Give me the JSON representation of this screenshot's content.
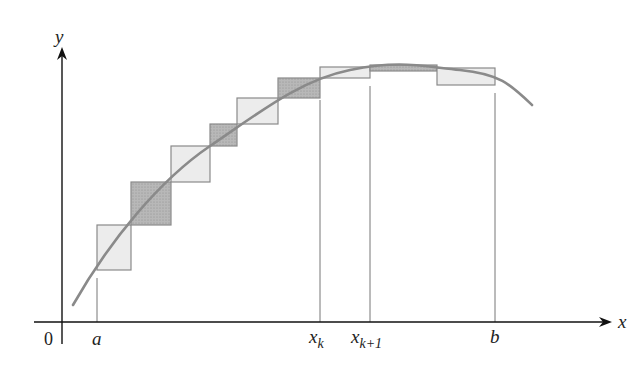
{
  "labels": {
    "y_axis": "y",
    "x_axis": "x",
    "origin": "0",
    "a": "a",
    "x_k_base": "x",
    "x_k_sub": "k",
    "x_k1_base": "x",
    "x_k1_sub": "k+1",
    "b": "b"
  },
  "colors": {
    "axis": "#111111",
    "curve": "#8a8a8a",
    "light_fill": "#ececec",
    "dark_fill": "#b4b4b4",
    "rect_stroke": "#8a8a8a"
  },
  "rectangles": [
    {
      "x0": 97,
      "x1": 131,
      "ytop": 225,
      "ybot": 270,
      "shade": "light"
    },
    {
      "x0": 131,
      "x1": 171,
      "ytop": 182,
      "ybot": 225,
      "shade": "dark"
    },
    {
      "x0": 171,
      "x1": 210,
      "ytop": 146,
      "ybot": 182,
      "shade": "light"
    },
    {
      "x0": 210,
      "x1": 237,
      "ytop": 124,
      "ybot": 146,
      "shade": "dark"
    },
    {
      "x0": 237,
      "x1": 278,
      "ytop": 98,
      "ybot": 124,
      "shade": "light"
    },
    {
      "x0": 278,
      "x1": 320,
      "ytop": 78,
      "ybot": 98,
      "shade": "dark"
    },
    {
      "x0": 320,
      "x1": 370,
      "ytop": 67,
      "ybot": 78,
      "shade": "light"
    },
    {
      "x0": 370,
      "x1": 437,
      "ytop": 65,
      "ybot": 71,
      "shade": "dark"
    },
    {
      "x0": 437,
      "x1": 495,
      "ytop": 68,
      "ybot": 85,
      "shade": "light"
    }
  ]
}
